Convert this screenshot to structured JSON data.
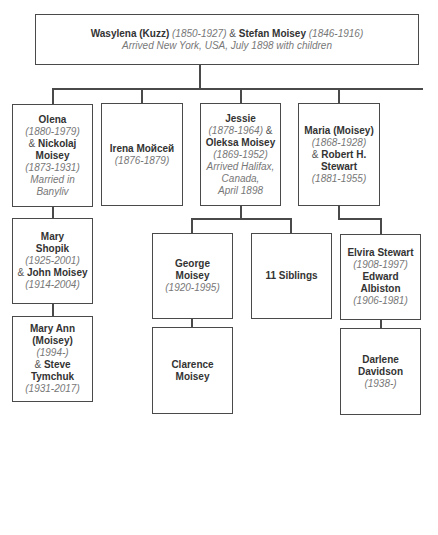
{
  "diagram": {
    "type": "family-tree",
    "root": {
      "line1": {
        "name1": "Wasylena (Kuzz)",
        "dates1": "(1850-1927)",
        "amp": " & ",
        "name2": "Stefan Moisey",
        "dates2": "(1846-1916)"
      },
      "note": "Arrived New York, USA, July 1898 with children"
    },
    "children": [
      {
        "id": "olena",
        "lines": [
          {
            "text": "Olena",
            "style": "bold"
          },
          {
            "text": "(1880-1979)",
            "style": "italic"
          },
          {
            "prefix": "& ",
            "text": "Nickolaj",
            "style": "bold"
          },
          {
            "text": "Moisey",
            "style": "bold"
          },
          {
            "text": "(1873-1931)",
            "style": "italic"
          },
          {
            "text": "Married in Banyliv",
            "style": "italic"
          }
        ]
      },
      {
        "id": "irena",
        "lines": [
          {
            "text": "Irena Мойсей",
            "style": "bold"
          },
          {
            "text": "(1876-1879)",
            "style": "italic"
          }
        ]
      },
      {
        "id": "jessie",
        "lines": [
          {
            "text": "Jessie",
            "style": "bold"
          },
          {
            "text": "(1878-1964)",
            "style": "italic",
            "suffix": " &"
          },
          {
            "text": "Oleksa Moisey",
            "style": "bold"
          },
          {
            "text": "(1869-1952)",
            "style": "italic"
          },
          {
            "text": "Arrived Halifax,",
            "style": "italic"
          },
          {
            "text": "Canada,",
            "style": "italic"
          },
          {
            "text": "April 1898",
            "style": "italic"
          }
        ]
      },
      {
        "id": "maria",
        "lines": [
          {
            "text": "Maria (Moisey)",
            "style": "bold"
          },
          {
            "text": "(1868-1928)",
            "style": "italic"
          },
          {
            "prefix": "& ",
            "text": "Robert H.",
            "style": "bold"
          },
          {
            "text": "Stewart",
            "style": "bold"
          },
          {
            "text": "(1881-1955)",
            "style": "italic"
          }
        ]
      }
    ],
    "grandchildren": [
      {
        "id": "mary",
        "parent": "olena",
        "lines": [
          {
            "text": "Mary",
            "style": "bold"
          },
          {
            "text": "Shopik",
            "style": "bold"
          },
          {
            "text": "(1925-2001)",
            "style": "italic"
          },
          {
            "prefix": "& ",
            "text": "John Moisey",
            "style": "bold"
          },
          {
            "text": "(1914-2004)",
            "style": "italic"
          }
        ]
      },
      {
        "id": "george",
        "parent": "jessie",
        "lines": [
          {
            "text": "George",
            "style": "bold"
          },
          {
            "text": "Moisey",
            "style": "bold"
          },
          {
            "text": "(1920-1995)",
            "style": "italic"
          }
        ]
      },
      {
        "id": "siblings",
        "parent": "jessie",
        "lines": [
          {
            "text": "11 Siblings",
            "style": "bold"
          }
        ]
      },
      {
        "id": "elvira",
        "parent": "maria",
        "lines": [
          {
            "text": "Elvira Stewart",
            "style": "bold"
          },
          {
            "text": "(1908-1997)",
            "style": "italic"
          },
          {
            "text": "Edward Albiston",
            "style": "bold"
          },
          {
            "text": "(1906-1981)",
            "style": "italic"
          }
        ]
      }
    ],
    "great_grandchildren": [
      {
        "id": "maryann",
        "parent": "mary",
        "lines": [
          {
            "text": "Mary Ann",
            "style": "bold"
          },
          {
            "text": "(Moisey)",
            "style": "bold"
          },
          {
            "text": "(1994-)",
            "style": "italic"
          },
          {
            "prefix": "& ",
            "text": "Steve",
            "style": "bold"
          },
          {
            "text": "Tymchuk",
            "style": "bold"
          },
          {
            "text": "(1931-2017)",
            "style": "italic"
          }
        ]
      },
      {
        "id": "clarence",
        "parent": "george",
        "lines": [
          {
            "text": "Clarence",
            "style": "bold"
          },
          {
            "text": "Moisey",
            "style": "bold"
          }
        ]
      },
      {
        "id": "darlene",
        "parent": "elvira",
        "lines": [
          {
            "text": "Darlene Davidson",
            "style": "bold"
          },
          {
            "text": "(1938-)",
            "style": "italic"
          }
        ]
      }
    ]
  },
  "colors": {
    "line": "#4a4a4a",
    "bold_text": "#333333",
    "italic_text": "#777777",
    "background": "#ffffff"
  }
}
